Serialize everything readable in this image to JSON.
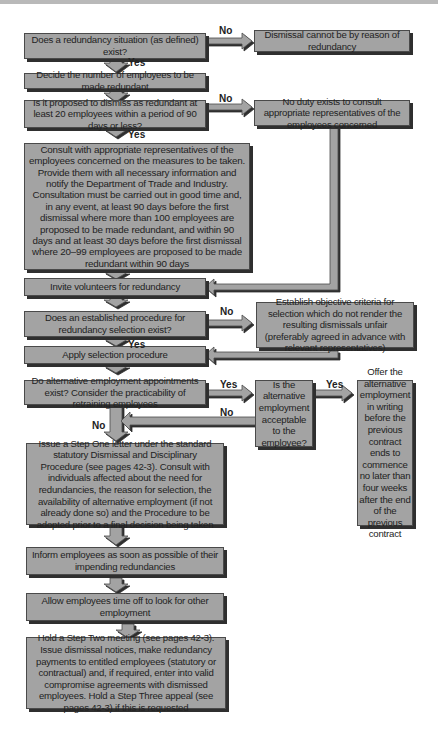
{
  "flowchart": {
    "nodes": {
      "q_redundancy_exists": "Does a redundancy situation (as defined) exist?",
      "no_redundancy": "Dismissal cannot be by reason of redundancy",
      "decide_number": "Decide the number of employees to be made redundant",
      "q_twenty_employees": "Is it proposed to dismiss as redundant at least 20 employees within a period of 90 days or less?",
      "no_duty_consult": "No duty exists to consult appropriate representatives of the employees concerned",
      "consult_reps": "Consult with appropriate representatives of the employees concerned on the measures to be taken. Provide them with all necessary information and notify the Department of Trade and Industry. Consultation must be carried out in good time and, in any event, at least 90 days before the first dismissal where more than 100 employees are proposed to be made redundant, and within 90 days and at least 30 days before the first dismissal where 20–99 employees are proposed to be made redundant within 90 days",
      "invite_volunteers": "Invite volunteers for redundancy",
      "q_procedure_exists": "Does an established procedure for redundancy selection exist?",
      "establish_criteria": "Establish objective criteria for selection which do not render the resulting dismissals unfair (preferably agreed in advance with relevant representatives)",
      "apply_selection": "Apply selection procedure",
      "q_alternative_exists": "Do alternative employment appointments exist? Consider the practicability of retraining employees",
      "q_alternative_acceptable": "Is the alternative employment acceptable to the employee?",
      "offer_alternative": "Offer the alternative employment in writing before the previous contract ends to commence no later than four weeks after the end of the previous contract",
      "step_one_letter": "Issue a Step One letter under the standard statutory Dismissal and Disciplinary Procedure (see pages 42-3). Consult with individuals affected about the need for redundancies, the reason for selection, the availability of alternative employment (if not already done so) and the Procedure to be adopted prior to a final decision being taken",
      "inform_employees": "Inform employees as soon as possible of their impending redundancies",
      "allow_time_off": "Allow employees time off to look for other employment",
      "step_two_meeting": "Hold a Step Two meeting (see pages 42-3). Issue dismissal notices, make redundancy payments to entitled employees (statutory or contractual) and, if required, enter into valid compromise agreements with dismissed employees. Hold a Step Three appeal (see pages 42-3) if this is requested"
    },
    "edge_labels": {
      "redundancy_no": "No",
      "redundancy_yes": "Yes",
      "twenty_no": "No",
      "twenty_yes": "Yes",
      "procedure_no": "No",
      "procedure_yes": "Yes",
      "alternative_yes": "Yes",
      "alternative_no": "No",
      "acceptable_yes": "Yes",
      "acceptable_no": "No"
    },
    "colors": {
      "box_fill": "#a3a3a3",
      "box_border": "#4a4a4a",
      "shadow": "#2f2f2f",
      "arrow_fill": "#a3a3a3"
    }
  }
}
